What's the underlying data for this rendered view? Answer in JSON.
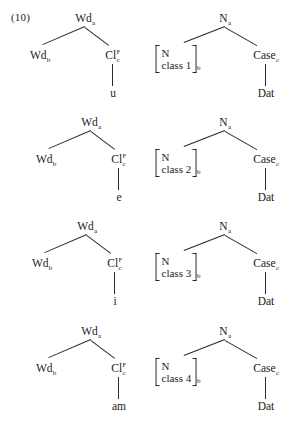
{
  "figure": {
    "example_number": "(10)",
    "rows": [
      {
        "word_tree": {
          "root": {
            "label": "Wd",
            "index": "a"
          },
          "left_daughter": {
            "label": "Wd",
            "index": "b"
          },
          "right_daughter": {
            "label": "Cl",
            "index": "c",
            "superscript": "F"
          },
          "terminal": "u"
        },
        "noun_tree": {
          "root": {
            "label": "N",
            "index": "a"
          },
          "feature_matrix": {
            "line1": "N",
            "line2": "class 1",
            "index": "b"
          },
          "case_node": {
            "label": "Case",
            "index": "c"
          },
          "terminal": "Dat"
        }
      },
      {
        "word_tree": {
          "root": {
            "label": "Wd",
            "index": "a"
          },
          "left_daughter": {
            "label": "Wd",
            "index": "b"
          },
          "right_daughter": {
            "label": "Cl",
            "index": "c",
            "superscript": "F"
          },
          "terminal": "e"
        },
        "noun_tree": {
          "root": {
            "label": "N",
            "index": "a"
          },
          "feature_matrix": {
            "line1": "N",
            "line2": "class 2",
            "index": "b"
          },
          "case_node": {
            "label": "Case",
            "index": "c"
          },
          "terminal": "Dat"
        }
      },
      {
        "word_tree": {
          "root": {
            "label": "Wd",
            "index": "a"
          },
          "left_daughter": {
            "label": "Wd",
            "index": "b"
          },
          "right_daughter": {
            "label": "Cl",
            "index": "c",
            "superscript": "F"
          },
          "terminal": "i"
        },
        "noun_tree": {
          "root": {
            "label": "N",
            "index": "a"
          },
          "feature_matrix": {
            "line1": "N",
            "line2": "class 3",
            "index": "b"
          },
          "case_node": {
            "label": "Case",
            "index": "c"
          },
          "terminal": "Dat"
        }
      },
      {
        "word_tree": {
          "root": {
            "label": "Wd",
            "index": "a"
          },
          "left_daughter": {
            "label": "Wd",
            "index": "b"
          },
          "right_daughter": {
            "label": "Cl",
            "index": "c",
            "superscript": "F"
          },
          "terminal": "am"
        },
        "noun_tree": {
          "root": {
            "label": "N",
            "index": "a"
          },
          "feature_matrix": {
            "line1": "N",
            "line2": "class 4",
            "index": "b"
          },
          "case_node": {
            "label": "Case",
            "index": "c"
          },
          "terminal": "Dat"
        }
      }
    ]
  },
  "colors": {
    "ink": "#1a1a1a",
    "line": "#2b2b2b",
    "background": "#ffffff"
  }
}
